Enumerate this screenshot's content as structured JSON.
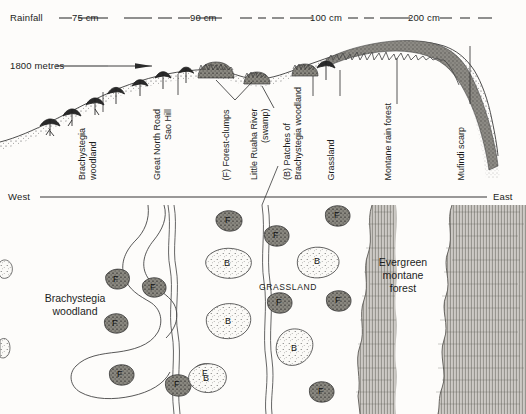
{
  "figure": {
    "type": "transect-profile-and-map",
    "background_color": "#fdfcfa",
    "ink_color": "#1c1c1c"
  },
  "profile": {
    "rainfall_axis_label": "Rainfall",
    "rainfall_stations": [
      {
        "label": "75 cm",
        "x": 88
      },
      {
        "label": "90 cm",
        "x": 205
      },
      {
        "label": "100 cm",
        "x": 328
      },
      {
        "label": "200 cm",
        "x": 424
      }
    ],
    "altitude_label": "1800 metres",
    "features": [
      {
        "label": "Brachystegia\nwoodland",
        "line1": "Brachystegia",
        "line2": "woodland",
        "x": 103,
        "leader_top": 92
      },
      {
        "label": "Great North Road\nSao Hill",
        "line1": "Great North Road",
        "line2": "Sao Hill",
        "x": 178,
        "leader_top": 74
      },
      {
        "label": "(F) Forest-clumps",
        "line1": "(F) Forest-clumps",
        "line2": "",
        "x": 235,
        "leader_top": 78
      },
      {
        "label": "Little Ruaha River\n(swamp)",
        "line1": "Little Ruaha River",
        "line2": "(swamp)",
        "x": 274,
        "leader_top": 83
      },
      {
        "label": "(B) Patches of\nBrachystegia woodland",
        "line1": "(B) Patches of",
        "line2": "Brachystegia woodland",
        "x": 313,
        "leader_top": 76
      },
      {
        "label": "Grassland",
        "line1": "Grassland",
        "line2": "",
        "x": 340,
        "leader_top": 70
      },
      {
        "label": "Montane rain forest",
        "line1": "Montane rain forest",
        "line2": "",
        "x": 397,
        "leader_top": 58
      },
      {
        "label": "Mufindi scarp",
        "line1": "Mufindi scarp",
        "line2": "",
        "x": 470,
        "leader_top": 44
      }
    ]
  },
  "direction_axis": {
    "west_label": "West",
    "east_label": "East"
  },
  "map": {
    "labels": [
      {
        "name": "brachystegia-woodland",
        "line1": "Brachystegia",
        "line2": "woodland",
        "x": 63,
        "y": 292,
        "style": "normal"
      },
      {
        "name": "grassland",
        "line1": "GRASSLAND",
        "line2": "",
        "x": 285,
        "y": 286,
        "style": "caps"
      },
      {
        "name": "evergreen-montane-forest",
        "line1": "Evergreen",
        "line2": "montane",
        "line3": "forest",
        "x": 398,
        "y": 262,
        "style": "normal"
      }
    ],
    "patch_legend": {
      "forest_clump_symbol": "F",
      "brachystegia_patch_symbol": "B"
    },
    "forest_clumps": [
      {
        "x": 118,
        "y": 281
      },
      {
        "x": 155,
        "y": 289
      },
      {
        "x": 229,
        "y": 222
      },
      {
        "x": 117,
        "y": 325
      },
      {
        "x": 122,
        "y": 376
      },
      {
        "x": 178,
        "y": 386
      },
      {
        "x": 182,
        "y": 393
      },
      {
        "x": 206,
        "y": 375
      },
      {
        "x": 277,
        "y": 237
      },
      {
        "x": 338,
        "y": 217
      },
      {
        "x": 339,
        "y": 302
      },
      {
        "x": 280,
        "y": 304
      },
      {
        "x": 322,
        "y": 393
      }
    ],
    "brachystegia_patches": [
      {
        "x": 228,
        "y": 265
      },
      {
        "x": 229,
        "y": 325
      },
      {
        "x": 207,
        "y": 378
      },
      {
        "x": 318,
        "y": 263
      },
      {
        "x": 298,
        "y": 350
      }
    ]
  }
}
